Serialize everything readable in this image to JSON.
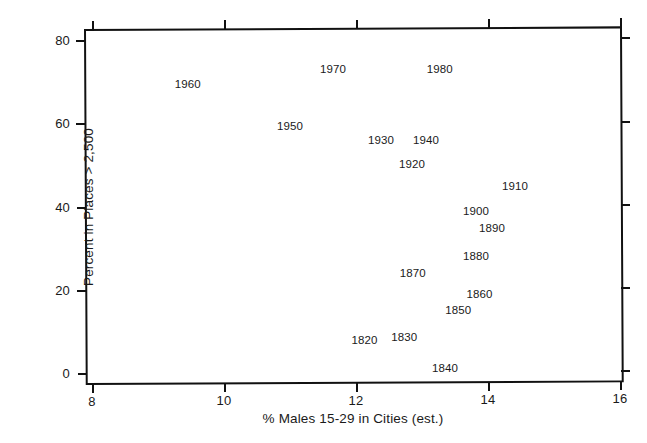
{
  "chart_data": {
    "type": "scatter",
    "title": "",
    "xlabel": "% Males 15-29 in Cities (est.)",
    "ylabel": "Percent in Places > 2,500",
    "xlim": [
      7.6,
      16.3
    ],
    "ylim": [
      -2,
      83
    ],
    "grid": false,
    "legend": null,
    "marker_style": "text-label",
    "xticks": [
      8,
      10,
      12,
      14,
      16
    ],
    "xtick_labels": [
      "8",
      "10",
      "12",
      "14",
      "16"
    ],
    "yticks": [
      0,
      20,
      40,
      60,
      80
    ],
    "ytick_labels": [
      "0",
      "20",
      "40",
      "60",
      "80"
    ],
    "points": [
      {
        "label": "1820",
        "x": 12.13,
        "y": 7.9
      },
      {
        "label": "1830",
        "x": 12.73,
        "y": 8.6
      },
      {
        "label": "1840",
        "x": 13.35,
        "y": 1.1
      },
      {
        "label": "1850",
        "x": 13.55,
        "y": 15.1
      },
      {
        "label": "1860",
        "x": 13.87,
        "y": 19.0
      },
      {
        "label": "1870",
        "x": 12.86,
        "y": 24.0
      },
      {
        "label": "1880",
        "x": 13.82,
        "y": 28.1
      },
      {
        "label": "1890",
        "x": 14.06,
        "y": 34.9
      },
      {
        "label": "1900",
        "x": 13.82,
        "y": 38.9
      },
      {
        "label": "1910",
        "x": 14.41,
        "y": 44.9
      },
      {
        "label": "1920",
        "x": 12.85,
        "y": 50.2
      },
      {
        "label": "1930",
        "x": 12.38,
        "y": 56.0
      },
      {
        "label": "1940",
        "x": 13.06,
        "y": 56.0
      },
      {
        "label": "1950",
        "x": 11.0,
        "y": 59.4
      },
      {
        "label": "1960",
        "x": 9.45,
        "y": 69.5
      },
      {
        "label": "1970",
        "x": 11.65,
        "y": 73.1
      },
      {
        "label": "1980",
        "x": 13.27,
        "y": 73.1
      }
    ]
  },
  "axes": {
    "x_title": "% Males 15-29 in Cities (est.)",
    "y_title": "Percent in Places > 2,500"
  },
  "colors": {
    "frame": "#111111",
    "text": "#1a1a1a",
    "background": "#ffffff"
  }
}
